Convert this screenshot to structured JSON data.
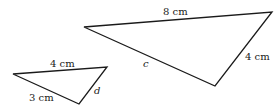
{
  "diagram": {
    "large_triangle": {
      "vertices": [
        [
          84,
          27
        ],
        [
          272,
          12
        ],
        [
          215,
          86
        ]
      ],
      "labels": {
        "top": "8 cm",
        "right": "4 cm",
        "left": "c"
      }
    },
    "small_triangle": {
      "vertices": [
        [
          13,
          74
        ],
        [
          107,
          67
        ],
        [
          79,
          104
        ]
      ],
      "labels": {
        "top": "4 cm",
        "left": "3 cm",
        "right": "d"
      }
    },
    "colors": {
      "stroke": "#1a1a1a",
      "background": "#ffffff"
    }
  }
}
